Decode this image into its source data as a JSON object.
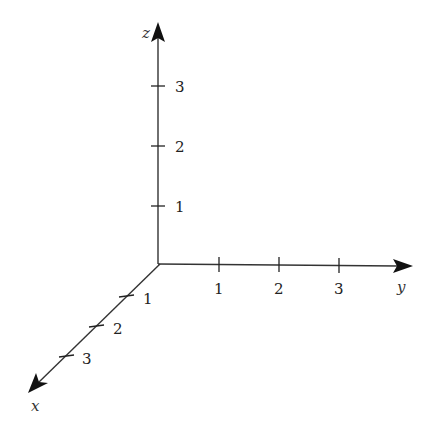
{
  "diagram": {
    "origin": [
      160,
      264
    ],
    "colors": {
      "axis": "#333333",
      "text": "#222222",
      "background": "#ffffff"
    },
    "axes": [
      {
        "name": "x",
        "label": "x",
        "direction": "down-left",
        "ticks": [
          {
            "value": "1",
            "pos": [
              127,
              296
            ]
          },
          {
            "value": "2",
            "pos": [
              97,
              326
            ]
          },
          {
            "value": "3",
            "pos": [
              67,
              356
            ]
          }
        ]
      },
      {
        "name": "y",
        "label": "y",
        "direction": "right",
        "ticks": [
          {
            "value": "1",
            "pos": [
              219,
              264
            ]
          },
          {
            "value": "2",
            "pos": [
              279,
              264
            ]
          },
          {
            "value": "3",
            "pos": [
              339,
              264
            ]
          }
        ]
      },
      {
        "name": "z",
        "label": "z",
        "direction": "up",
        "ticks": [
          {
            "value": "1",
            "pos": [
              158,
              206
            ]
          },
          {
            "value": "2",
            "pos": [
              158,
              146
            ]
          },
          {
            "value": "3",
            "pos": [
              158,
              86
            ]
          }
        ]
      }
    ]
  },
  "labels": {
    "x": "x",
    "y": "y",
    "z": "z",
    "x1": "1",
    "x2": "2",
    "x3": "3",
    "y1": "1",
    "y2": "2",
    "y3": "3",
    "z1": "1",
    "z2": "2",
    "z3": "3"
  }
}
